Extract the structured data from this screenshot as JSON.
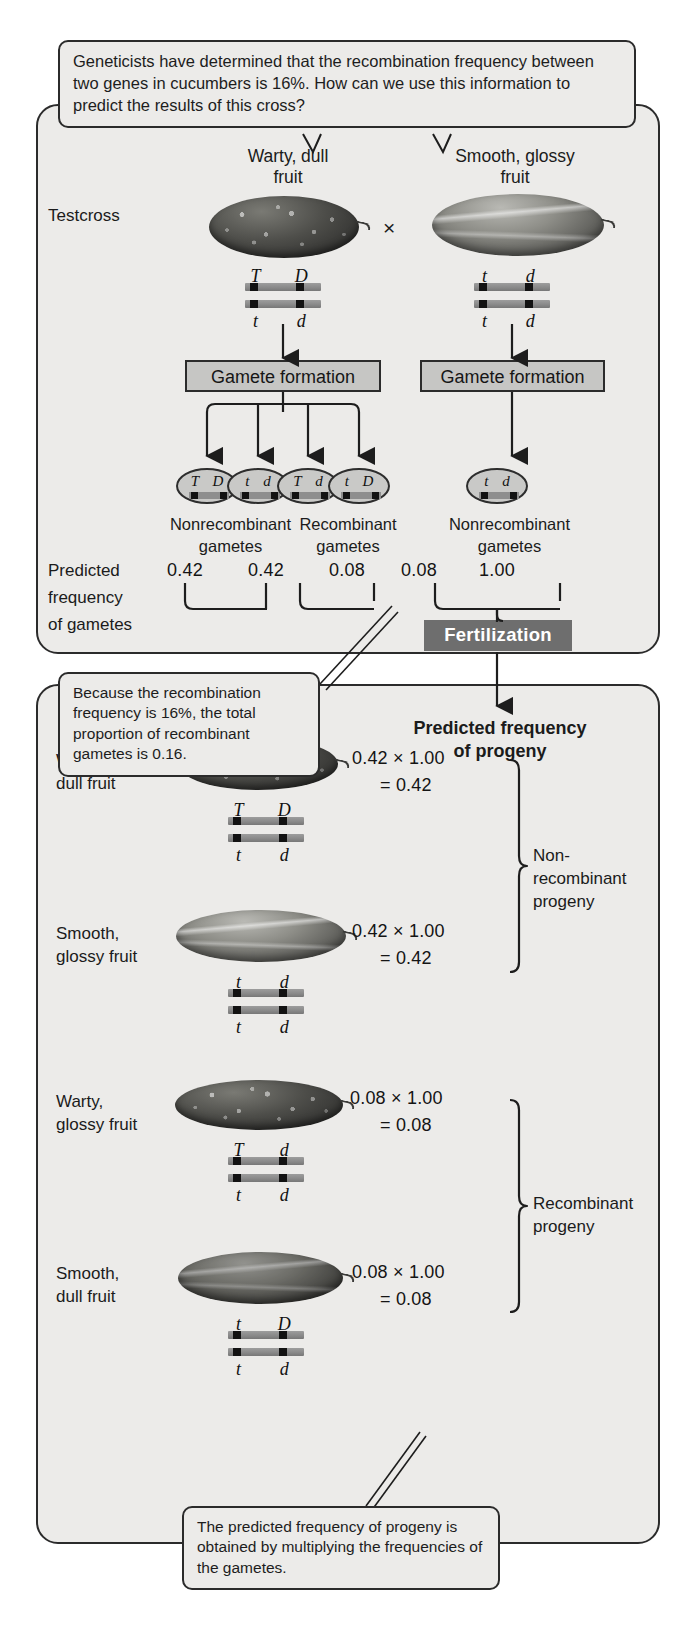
{
  "figure": {
    "callout_top": "Geneticists have determined that the recombination frequency between two genes in cucumbers is 16%.  How can we use this information to predict the results of this cross?",
    "callout_recombination": "Because the recombination frequency is 16%, the total proportion of recombinant gametes is 0.16.",
    "callout_bottom": "The predicted frequency of progeny is obtained by multiplying the frequencies of the gametes."
  },
  "cross": {
    "testcross_label": "Testcross",
    "times_symbol": "×",
    "parents": [
      {
        "phenotype_line1": "Warty, dull",
        "phenotype_line2": "fruit",
        "top_alleles": [
          "T",
          "D"
        ],
        "bottom_alleles": [
          "t",
          "d"
        ],
        "fruit": "warty-cucumber"
      },
      {
        "phenotype_line1": "Smooth, glossy",
        "phenotype_line2": "fruit",
        "top_alleles": [
          "t",
          "d"
        ],
        "bottom_alleles": [
          "t",
          "d"
        ],
        "fruit": "smooth-cucumber"
      }
    ],
    "gamete_formation_label": "Gamete formation",
    "gametes_left": [
      {
        "alleles": "T D"
      },
      {
        "alleles": "t d"
      },
      {
        "alleles": "T d"
      },
      {
        "alleles": "t D"
      }
    ],
    "gametes_right": [
      {
        "alleles": "t d"
      }
    ],
    "gamete_group_labels": [
      {
        "line1": "Nonrecombinant",
        "line2": "gametes"
      },
      {
        "line1": "Recombinant",
        "line2": "gametes"
      },
      {
        "line1": "Nonrecombinant",
        "line2": "gametes"
      }
    ],
    "predicted_frequency_label": [
      "Predicted",
      "frequency",
      "of gametes"
    ],
    "gamete_frequencies": [
      "0.42",
      "0.42",
      "0.08",
      "0.08",
      "1.00"
    ],
    "fertilization_label": "Fertilization"
  },
  "progeny": {
    "header": [
      "Predicted frequency",
      "of progeny"
    ],
    "rows": [
      {
        "phenotype_line1": "Warty,",
        "phenotype_line2": "dull fruit",
        "fruit": "warty-cucumber",
        "calc": "0.42 × 1.00",
        "result": "= 0.42",
        "top_alleles": [
          "T",
          "D"
        ],
        "bottom_alleles": [
          "t",
          "d"
        ]
      },
      {
        "phenotype_line1": "Smooth,",
        "phenotype_line2": "glossy fruit",
        "fruit": "smooth-cucumber",
        "calc": "0.42 × 1.00",
        "result": "= 0.42",
        "top_alleles": [
          "t",
          "d"
        ],
        "bottom_alleles": [
          "t",
          "d"
        ]
      },
      {
        "phenotype_line1": "Warty,",
        "phenotype_line2": "glossy fruit",
        "fruit": "warty-glossy-cucumber",
        "calc": "0.08 × 1.00",
        "result": "= 0.08",
        "top_alleles": [
          "T",
          "d"
        ],
        "bottom_alleles": [
          "t",
          "d"
        ]
      },
      {
        "phenotype_line1": "Smooth,",
        "phenotype_line2": "dull fruit",
        "fruit": "smooth-dull-cucumber",
        "calc": "0.08 × 1.00",
        "result": "= 0.08",
        "top_alleles": [
          "t",
          "D"
        ],
        "bottom_alleles": [
          "t",
          "d"
        ]
      }
    ],
    "group_labels": [
      {
        "line1": "Non-",
        "line2": "recombinant",
        "line3": "progeny"
      },
      {
        "line1": "Recombinant",
        "line2": "progeny",
        "line3": ""
      }
    ]
  },
  "colors": {
    "panel_bg": "#ecebe9",
    "ink": "#2b2b2b",
    "box_gray": "#c6c6c4",
    "fertilization_bg": "#6e6e6e",
    "chromosome_gray": "#8e8e8e",
    "locus_black": "#121212"
  }
}
